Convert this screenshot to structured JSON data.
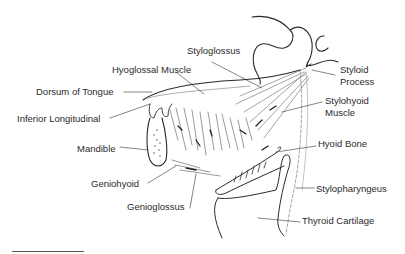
{
  "figure": {
    "type": "anatomical-illustration",
    "labels": {
      "styloglossus": "Styloglossus",
      "hyoglossal_muscle": "Hyoglossal Muscle",
      "dorsum_of_tongue": "Dorsum of Tongue",
      "inferior_longitudinal": "Inferior Longitudinal",
      "mandible": "Mandible",
      "geniohyoid": "Geniohyoid",
      "genioglossus": "Genioglossus",
      "styloid_process_line1": "Styloid",
      "styloid_process_line2": "Process",
      "stylohyoid_muscle_line1": "Stylohyoid",
      "stylohyoid_muscle_line2": "Muscle",
      "hyoid_bone": "Hyoid Bone",
      "stylopharyngeus": "Stylopharyngeus",
      "thyroid_cartilage": "Thyroid Cartilage"
    },
    "colors": {
      "ink": "#2a2a2a",
      "hatch": "#555555",
      "background": "#ffffff"
    }
  }
}
